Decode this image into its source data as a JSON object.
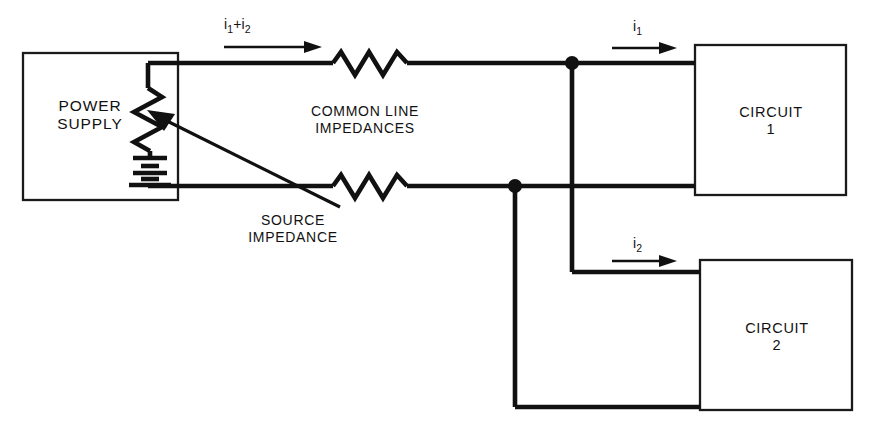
{
  "diagram": {
    "background_color": "#ffffff",
    "line_color": "#111111",
    "blocks": {
      "power_supply": {
        "label_line_1": "POWER",
        "label_line_2": "SUPPLY"
      },
      "circuit_1": {
        "label_line_1": "CIRCUIT",
        "label_line_2": "1"
      },
      "circuit_2": {
        "label_line_1": "CIRCUIT",
        "label_line_2": "2"
      }
    },
    "annotations": {
      "common_line_impedances_line_1": "COMMON LINE",
      "common_line_impedances_line_2": "IMPEDANCES",
      "source_impedance_line_1": "SOURCE",
      "source_impedance_line_2": "IMPEDANCE"
    },
    "currents": {
      "total": {
        "symbol": "i",
        "sub_1": "1",
        "operator": "+",
        "symbol_2": "i",
        "sub_2": "2"
      },
      "branch_1": {
        "symbol": "i",
        "sub": "1"
      },
      "branch_2": {
        "symbol": "i",
        "sub": "2"
      }
    },
    "components": [
      {
        "name": "source-impedance-resistor",
        "type": "potentiometer-resistor"
      },
      {
        "name": "battery",
        "type": "battery",
        "cells": 3
      },
      {
        "name": "common-line-resistor-upper",
        "type": "resistor"
      },
      {
        "name": "common-line-resistor-lower",
        "type": "resistor"
      },
      {
        "name": "junction-node-upper",
        "type": "junction"
      },
      {
        "name": "junction-node-lower",
        "type": "junction"
      }
    ]
  }
}
